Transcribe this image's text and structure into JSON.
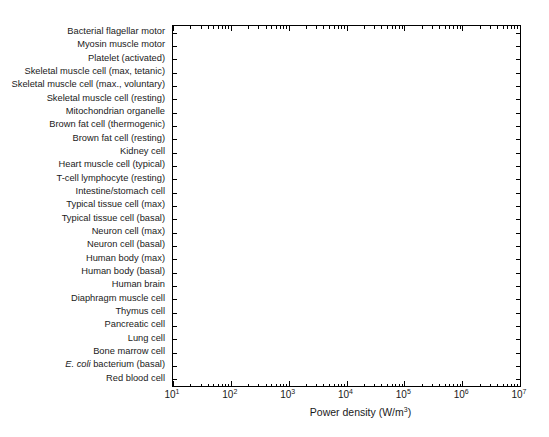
{
  "chart_data": {
    "type": "bar",
    "orientation": "horizontal",
    "title": "",
    "xlabel": "Power density (W/m3)",
    "xlabel_html": "Power density (W/m<sup>3</sup>)",
    "ylabel": "",
    "xscale": "log",
    "xlim": [
      10,
      10000000
    ],
    "xticks": [
      10,
      100,
      1000,
      10000,
      100000,
      1000000,
      10000000
    ],
    "xticklabels": [
      "10^1",
      "10^2",
      "10^3",
      "10^4",
      "10^5",
      "10^6",
      "10^7"
    ],
    "grid": false,
    "legend": false,
    "units": "W/m^3",
    "categories": [
      "Bacterial flagellar motor",
      "Myosin muscle motor",
      "Platelet (activated)",
      "Skeletal muscle cell (max, tetanic)",
      "Skeletal muscle cell (max., voluntary)",
      "Skeletal muscle cell (resting)",
      "Mitochondrian organelle",
      "Brown fat cell (thermogenic)",
      "Brown fat cell (resting)",
      "Kidney cell",
      "Heart muscle cell (typical)",
      "T-cell lymphocyte (resting)",
      "Intestine/stomach cell",
      "Typical tissue cell (max)",
      "Typical tissue cell (basal)",
      "Neuron cell (max)",
      "Neuron cell (basal)",
      "Human body (max)",
      "Human body (basal)",
      "Human brain",
      "Diaphragm muscle cell",
      "Thymus cell",
      "Pancreatic cell",
      "Lung cell",
      "Bone marrow cell",
      "E. coli bacterium (basal)",
      "Red blood cell"
    ],
    "categories_italic_prefix": {
      "25": "E. coli"
    },
    "values": [
      2300000,
      2300000,
      900000,
      980000,
      35000,
      2400,
      620000,
      380000,
      280,
      30000,
      28000,
      250000,
      68000,
      75000,
      4500,
      20000,
      12000,
      15000,
      1100,
      11000,
      9500,
      9500,
      8500,
      8000,
      5000,
      230,
      110
    ],
    "bar_colors": [
      "#0d0d0d",
      "#0d0d0d",
      "#0d0d0d",
      "#9a9a9a",
      "#9a9a9a",
      "#9a9a9a",
      "#0d0d0d",
      "#d9d9d9",
      "#d9d9d9",
      "#0d0d0d",
      "#0d0d0d",
      "#0d0d0d",
      "#0d0d0d",
      "#0d0d0d",
      "#0d0d0d",
      "#8c8c8c",
      "#8c8c8c",
      "#6e6e6e",
      "#6e6e6e",
      "#0d0d0d",
      "#0d0d0d",
      "#0d0d0d",
      "#0d0d0d",
      "#0d0d0d",
      "#0d0d0d",
      "#0d0d0d",
      "#0d0d0d"
    ]
  },
  "colors": {
    "background": "#ffffff",
    "axis": "#000000",
    "text": "#1a1a1a",
    "bar_dark": "#0d0d0d",
    "bar_mid_gray": "#9a9a9a",
    "bar_light_gray": "#d9d9d9",
    "bar_gray": "#6e6e6e"
  }
}
